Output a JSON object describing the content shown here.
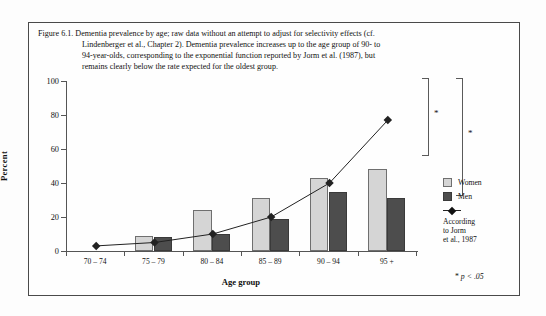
{
  "figure": {
    "caption_label": "Figure 6.1.",
    "caption_lines": [
      "Figure 6.1. Dementia prevalence by age; raw data without an attempt to adjust for selectivity effects (cf.",
      "Lindenberger et al., Chapter 2). Dementia prevalence increases up to the age group of 90- to",
      "94-year-olds, corresponding to the exponential function reported by Jorm et al. (1987), but",
      "remains clearly below the rate expected for the oldest group."
    ]
  },
  "legend": {
    "women_label": "Women",
    "men_label": "Men",
    "line_label_lines": [
      "According",
      "to Jorm",
      "et al., 1987"
    ],
    "women_color": "#d5d5d5",
    "men_color": "#4d4d4d",
    "line_color": "#222222"
  },
  "significance": {
    "star": "*",
    "footnote_star": "*",
    "footnote_text": "p < .05"
  },
  "chart_data": {
    "type": "bar",
    "title": "Dementia prevalence by age",
    "xlabel": "Age group",
    "ylabel": "Percent",
    "ylim": [
      0,
      100
    ],
    "yticks": [
      0,
      20,
      40,
      60,
      80,
      100
    ],
    "ytick_labels": [
      "0",
      "20",
      "40",
      "60",
      "80",
      "100"
    ],
    "grid": false,
    "legend_position": "right",
    "categories": [
      "70 – 74",
      "75 – 79",
      "80 – 84",
      "85 – 89",
      "90 – 94",
      "95 +"
    ],
    "series": [
      {
        "name": "Women",
        "type": "bar",
        "color": "#d5d5d5",
        "values": [
          0,
          9,
          24,
          31,
          43,
          48
        ]
      },
      {
        "name": "Men",
        "type": "bar",
        "color": "#4d4d4d",
        "values": [
          0,
          8,
          10,
          19,
          35,
          31
        ]
      },
      {
        "name": "According to Jorm et al., 1987",
        "type": "line",
        "color": "#222222",
        "values": [
          3,
          5,
          10,
          20,
          40,
          77
        ]
      }
    ],
    "annotations": [
      {
        "text": "*",
        "note": "bracket between Jorm predicted and Women at 95+"
      },
      {
        "text": "*",
        "note": "bracket between Jorm predicted and Men at 95+"
      },
      {
        "text": "* p < .05",
        "note": "significance footnote"
      }
    ]
  }
}
